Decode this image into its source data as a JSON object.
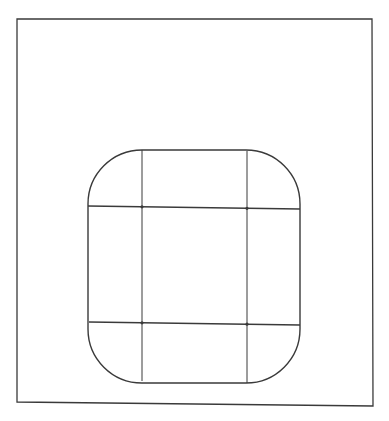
{
  "figure": {
    "stroke_color": "#3a3a3a",
    "background": "#ffffff",
    "outer_frame": {
      "x1": 17,
      "y1": 19,
      "x2": 372,
      "y2": 19,
      "x3": 373,
      "y3": 406,
      "x4": 17,
      "y4": 402
    },
    "rounded_square": {
      "left": 88,
      "top": 150,
      "right": 300,
      "bottom": 383,
      "radius": 54
    },
    "vertical_lines": [
      {
        "x_top": 142,
        "y_top": 150,
        "x_bottom": 142,
        "y_bottom": 381
      },
      {
        "x_top": 247,
        "y_top": 151,
        "x_bottom": 247,
        "y_bottom": 383
      }
    ],
    "horizontal_lines": [
      {
        "x_left": 88,
        "y_left": 206,
        "x_right": 300,
        "y_right": 209
      },
      {
        "x_left": 89,
        "y_left": 322,
        "x_right": 300,
        "y_right": 325
      }
    ]
  }
}
